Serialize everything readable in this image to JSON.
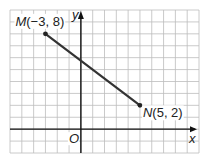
{
  "figure": {
    "type": "coordinate-plane",
    "x_axis_label": "x",
    "y_axis_label": "y",
    "origin_label": "O",
    "x_range": [
      -6,
      10
    ],
    "y_range": [
      -2,
      10
    ],
    "grid": true,
    "grid_step": 1
  },
  "points": [
    {
      "name": "M",
      "x": -3,
      "y": 8,
      "coords_text": "(−3, 8)"
    },
    {
      "name": "N",
      "x": 5,
      "y": 2,
      "coords_text": "(5, 2)"
    }
  ],
  "segments": [
    {
      "from": "M",
      "to": "N"
    }
  ],
  "colors": {
    "grid": "#bdbdbd",
    "axis": "#111111",
    "segment": "#333333",
    "background": "#ffffff"
  }
}
